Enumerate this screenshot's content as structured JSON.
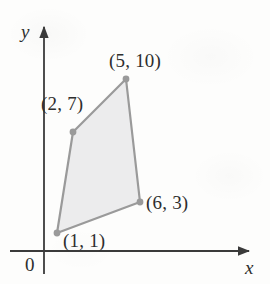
{
  "figure": {
    "name": "coordinate-plane-quadrilateral",
    "background_color": "#fdfdfc",
    "axes": {
      "x_label": "x",
      "y_label": "y",
      "origin_label": "0",
      "color": "#3a3a3a",
      "x_axis_y_px": 251,
      "y_axis_x_px": 44,
      "x_axis_start_px": 10,
      "x_axis_end_px": 253,
      "y_axis_top_px": 23,
      "y_axis_bottom_px": 274,
      "arrowheads": [
        "x-axis-arrow",
        "y-axis-arrow"
      ]
    },
    "shape": {
      "name": "shaded-quadrilateral",
      "fill_color": "#ececed",
      "stroke_color": "#9a9a9a",
      "stroke_width": 2.2,
      "vertex_dot_color": "#9a9a9a",
      "vertex_dot_radius": 3.4,
      "points_px": [
        [
          57,
          233
        ],
        [
          73,
          132
        ],
        [
          126,
          79
        ],
        [
          140,
          202
        ]
      ]
    },
    "vertex_labels": [
      {
        "id": "label-1-1",
        "text": "(1, 1)"
      },
      {
        "id": "label-2-7",
        "text": "(2, 7)"
      },
      {
        "id": "label-5-10",
        "text": "(5, 10)"
      },
      {
        "id": "label-6-3",
        "text": "(6, 3)"
      }
    ]
  },
  "chart_data": {
    "type": "scatter",
    "title": "",
    "xlabel": "x",
    "ylabel": "y",
    "grid": false,
    "legend": "none",
    "annotations": [
      "0"
    ],
    "series": [
      {
        "name": "quadrilateral-vertices",
        "closed": true,
        "fill": "#ececed",
        "stroke": "#9a9a9a",
        "x": [
          1,
          2,
          5,
          6
        ],
        "y": [
          1,
          7,
          10,
          3
        ],
        "point_labels": [
          "(1, 1)",
          "(2, 7)",
          "(5, 10)",
          "(6, 3)"
        ]
      }
    ],
    "xlim": [
      0,
      9
    ],
    "ylim": [
      0,
      13
    ]
  }
}
